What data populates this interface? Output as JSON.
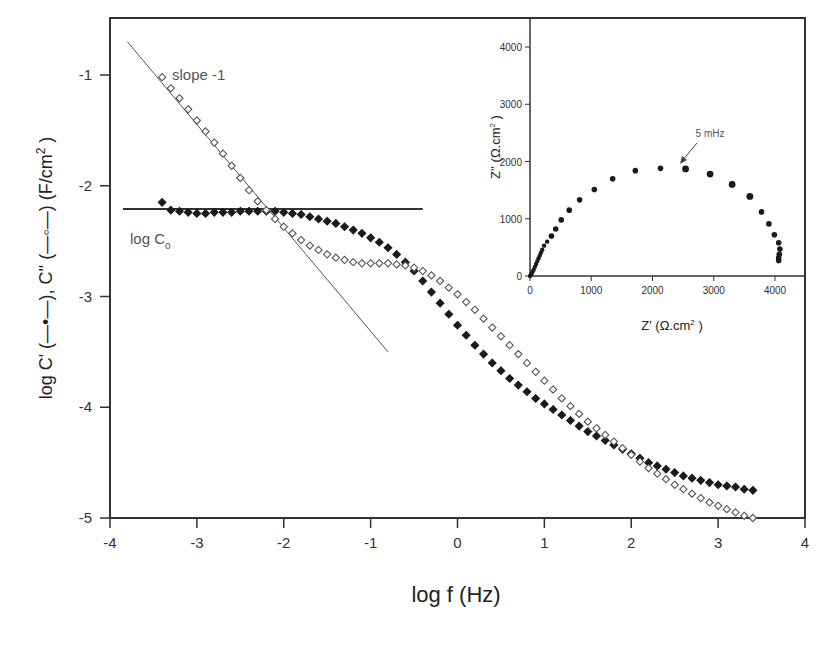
{
  "chart_data": [
    {
      "type": "scatter",
      "title": "",
      "xlabel": "log f (Hz)",
      "ylabel": "log C' (—•—), C'' (—○—) (F/cm²)",
      "xlim": [
        -4,
        4
      ],
      "ylim": [
        -5,
        -0.5
      ],
      "x_ticks": [
        "-4",
        "-3",
        "-2",
        "-1",
        "0",
        "1",
        "2",
        "3",
        "4"
      ],
      "y_ticks": [
        "-1",
        "-2",
        "-3",
        "-4",
        "-5"
      ],
      "grid": false,
      "series": [
        {
          "name": "C' (filled)",
          "marker": "filled-diamond",
          "x": [
            -3.4,
            -3.3,
            -3.2,
            -3.1,
            -3.0,
            -2.9,
            -2.8,
            -2.7,
            -2.6,
            -2.5,
            -2.4,
            -2.3,
            -2.2,
            -2.1,
            -2.0,
            -1.9,
            -1.8,
            -1.7,
            -1.6,
            -1.5,
            -1.4,
            -1.3,
            -1.2,
            -1.1,
            -1.0,
            -0.9,
            -0.8,
            -0.7,
            -0.6,
            -0.5,
            -0.4,
            -0.3,
            -0.2,
            -0.1,
            0.0,
            0.1,
            0.2,
            0.3,
            0.4,
            0.5,
            0.6,
            0.7,
            0.8,
            0.9,
            1.0,
            1.1,
            1.2,
            1.3,
            1.4,
            1.5,
            1.6,
            1.7,
            1.8,
            1.9,
            2.0,
            2.1,
            2.2,
            2.3,
            2.4,
            2.5,
            2.6,
            2.7,
            2.8,
            2.9,
            3.0,
            3.1,
            3.2,
            3.3,
            3.4
          ],
          "values": [
            -2.15,
            -2.22,
            -2.23,
            -2.24,
            -2.25,
            -2.25,
            -2.24,
            -2.24,
            -2.24,
            -2.23,
            -2.23,
            -2.23,
            -2.23,
            -2.23,
            -2.24,
            -2.25,
            -2.26,
            -2.28,
            -2.3,
            -2.32,
            -2.34,
            -2.37,
            -2.4,
            -2.43,
            -2.47,
            -2.51,
            -2.56,
            -2.62,
            -2.69,
            -2.77,
            -2.86,
            -2.96,
            -3.06,
            -3.16,
            -3.26,
            -3.35,
            -3.44,
            -3.52,
            -3.6,
            -3.67,
            -3.74,
            -3.8,
            -3.86,
            -3.92,
            -3.97,
            -4.02,
            -4.07,
            -4.12,
            -4.17,
            -4.22,
            -4.26,
            -4.3,
            -4.34,
            -4.38,
            -4.42,
            -4.46,
            -4.5,
            -4.53,
            -4.56,
            -4.59,
            -4.62,
            -4.64,
            -4.66,
            -4.68,
            -4.7,
            -4.71,
            -4.72,
            -4.74,
            -4.75
          ]
        },
        {
          "name": "C'' (open)",
          "marker": "open-diamond",
          "x": [
            -3.4,
            -3.3,
            -3.2,
            -3.1,
            -3.0,
            -2.9,
            -2.8,
            -2.7,
            -2.6,
            -2.5,
            -2.4,
            -2.3,
            -2.2,
            -2.1,
            -2.0,
            -1.9,
            -1.8,
            -1.7,
            -1.6,
            -1.5,
            -1.4,
            -1.3,
            -1.2,
            -1.1,
            -1.0,
            -0.9,
            -0.8,
            -0.7,
            -0.6,
            -0.5,
            -0.4,
            -0.3,
            -0.2,
            -0.1,
            0.0,
            0.1,
            0.2,
            0.3,
            0.4,
            0.5,
            0.6,
            0.7,
            0.8,
            0.9,
            1.0,
            1.1,
            1.2,
            1.3,
            1.4,
            1.5,
            1.6,
            1.7,
            1.8,
            1.9,
            2.0,
            2.1,
            2.2,
            2.3,
            2.4,
            2.5,
            2.6,
            2.7,
            2.8,
            2.9,
            3.0,
            3.1,
            3.2,
            3.3,
            3.4
          ],
          "values": [
            -1.02,
            -1.12,
            -1.21,
            -1.31,
            -1.41,
            -1.51,
            -1.61,
            -1.71,
            -1.82,
            -1.93,
            -2.04,
            -2.14,
            -2.22,
            -2.3,
            -2.37,
            -2.43,
            -2.49,
            -2.54,
            -2.58,
            -2.62,
            -2.65,
            -2.67,
            -2.69,
            -2.7,
            -2.7,
            -2.7,
            -2.7,
            -2.71,
            -2.72,
            -2.74,
            -2.77,
            -2.81,
            -2.86,
            -2.92,
            -2.98,
            -3.05,
            -3.12,
            -3.2,
            -3.28,
            -3.36,
            -3.44,
            -3.52,
            -3.6,
            -3.68,
            -3.76,
            -3.84,
            -3.92,
            -3.99,
            -4.06,
            -4.13,
            -4.19,
            -4.25,
            -4.31,
            -4.37,
            -4.43,
            -4.49,
            -4.55,
            -4.6,
            -4.65,
            -4.7,
            -4.74,
            -4.78,
            -4.82,
            -4.86,
            -4.89,
            -4.92,
            -4.95,
            -4.98,
            -5.0
          ]
        }
      ],
      "reference_lines": [
        {
          "name": "slope -1",
          "x": [
            -3.8,
            -0.8
          ],
          "y": [
            -0.7,
            -3.5
          ]
        },
        {
          "name": "log Co",
          "x": [
            -3.85,
            -0.4
          ],
          "y": [
            -2.21,
            -2.21
          ]
        }
      ],
      "annotations": [
        "slope -1",
        "log Cₒ"
      ]
    },
    {
      "type": "scatter",
      "title": "",
      "xlabel": "Z' (Ω.cm²)",
      "ylabel": "Z'' (Ω.cm²)",
      "xlim": [
        0,
        4500
      ],
      "ylim": [
        0,
        4500
      ],
      "x_ticks": [
        "0",
        "1000",
        "2000",
        "3000",
        "4000"
      ],
      "y_ticks": [
        "0",
        "1000",
        "2000",
        "3000",
        "4000"
      ],
      "grid": false,
      "series": [
        {
          "name": "Nyquist",
          "marker": "filled-circle",
          "x": [
            0,
            20,
            40,
            60,
            80,
            100,
            120,
            140,
            160,
            180,
            200,
            230,
            280,
            350,
            420,
            510,
            640,
            810,
            1050,
            1350,
            1720,
            2130,
            2540,
            2940,
            3300,
            3590,
            3780,
            3900,
            3990,
            4060,
            4080,
            4070,
            4060,
            4060
          ],
          "values": [
            0,
            30,
            70,
            110,
            160,
            210,
            260,
            310,
            360,
            410,
            460,
            530,
            600,
            700,
            820,
            980,
            1150,
            1330,
            1510,
            1700,
            1840,
            1880,
            1870,
            1780,
            1600,
            1390,
            1120,
            910,
            720,
            580,
            470,
            380,
            320,
            270
          ]
        }
      ],
      "annotations": [
        "5 mHz"
      ]
    }
  ],
  "main": {
    "xlabel": "log f (Hz)",
    "ylabel_parts": {
      "prefix": "log C' (",
      "mid": "), C'' (",
      "suffix": ") (F/cm",
      "sup": "2",
      "close": " )"
    },
    "x_ticks": [
      "-4",
      "-3",
      "-2",
      "-1",
      "0",
      "1",
      "2",
      "3",
      "4"
    ],
    "y_ticks": [
      "-1",
      "-2",
      "-3",
      "-4",
      "-5"
    ],
    "annot_slope": "slope -1",
    "annot_logc": "log C",
    "annot_logc_sub": "o"
  },
  "inset": {
    "xlabel": "Z' (Ω.cm",
    "ylabel": "Z'' (Ω.cm",
    "sup": "2",
    "close": " )",
    "x_ticks": [
      "0",
      "1000",
      "2000",
      "3000",
      "4000"
    ],
    "y_ticks": [
      "0",
      "1000",
      "2000",
      "3000",
      "4000"
    ],
    "annot": "5 mHz"
  },
  "colors": {
    "axis": "#333333",
    "marker": "#222222",
    "text": "#333333",
    "background": "#ffffff"
  }
}
